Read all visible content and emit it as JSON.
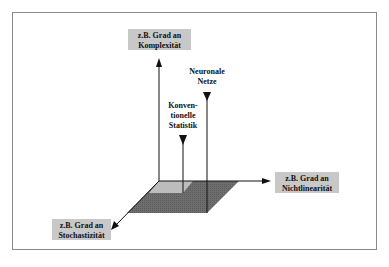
{
  "diagram": {
    "axes": {
      "vertical": {
        "line1": "z.B. Grad an",
        "line2": "Komplexität"
      },
      "horizontal": {
        "line1": "z.B. Grad an",
        "line2": "Nichtlinearität"
      },
      "diagonal": {
        "line1": "z.B. Grad an",
        "line2": "Stochastizität"
      }
    },
    "markers": {
      "neural": {
        "line1": "Neuronale",
        "line2": "Netze"
      },
      "conventional": {
        "line1": "Konven-",
        "line2": "tionelle",
        "line3": "Statistik"
      }
    },
    "colors": {
      "label_box": "#c8c8c8",
      "plane_dark": "#6e6e6e",
      "plane_light": "#bdbdbd",
      "frame": "#8a8a8a",
      "lines": "#111111"
    }
  }
}
